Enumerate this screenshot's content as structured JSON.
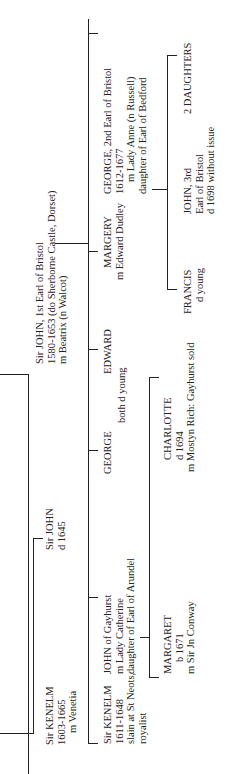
{
  "tree": {
    "root": {
      "lines": [
        "Sir JOHN, 1st Earl of Bristol",
        "1580-1653 (do Sherborne Castle, Dorset)",
        "m Beatrix (n Walcot)"
      ]
    },
    "left_branch": {
      "kenelm_sr": [
        "Sir KENELM",
        "1603-1665",
        "m Venetia"
      ],
      "john_sr": [
        "Sir JOHN",
        "d 1645"
      ]
    },
    "children": [
      {
        "lines": [
          "Sir KENELM",
          "1611-1648",
          "slain at St Neots,",
          "royalist"
        ]
      },
      {
        "lines": [
          "JOHN of Gayhurst",
          "m Lady Catherine",
          "daughter of Earl of Arundel"
        ]
      },
      {
        "lines": [
          "GEORGE"
        ]
      },
      {
        "lines": [
          "EDWARD"
        ]
      },
      {
        "lines": [
          "MARGERY",
          "m Edward Dudley"
        ]
      },
      {
        "lines": [
          "GEORGE, 2nd Earl of Bristol",
          "1612-1677",
          "m Lady Anne (n Russell)",
          "daughter of Earl of Bedford"
        ]
      }
    ],
    "george_edward_note": "both d young",
    "gayhurst_children": [
      {
        "lines": [
          "MARGARET",
          "b 1671",
          "m Sir Jn Conway"
        ]
      },
      {
        "lines": [
          "CHARLOTTE",
          "d 1694",
          "m Mostyn Rich: Gayhurst sold"
        ]
      }
    ],
    "bristol_children": [
      {
        "lines": [
          "FRANCIS",
          "d young"
        ]
      },
      {
        "lines": [
          "JOHN, 3rd",
          "Earl of Bristol",
          "d 1698 without issue"
        ]
      },
      {
        "lines": [
          "2 DAUGHTERS"
        ]
      }
    ]
  }
}
